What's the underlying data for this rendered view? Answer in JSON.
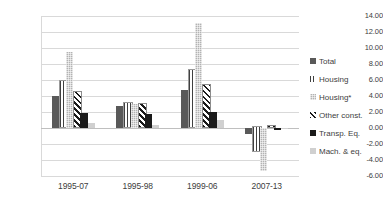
{
  "chart_data": {
    "type": "bar",
    "title": "",
    "subtitle": "",
    "xlabel": "",
    "ylabel": "",
    "ylim": [
      -6.0,
      14.0
    ],
    "ytick_step": 2.0,
    "yticks": [
      "14.00",
      "12.00",
      "10.00",
      "8.00",
      "6.00",
      "4.00",
      "2.00",
      "0.00",
      "-2.00",
      "-4.00",
      "-6.00"
    ],
    "ytick_values": [
      14,
      12,
      10,
      8,
      6,
      4,
      2,
      0,
      -2,
      -4,
      -6
    ],
    "grid": true,
    "legend_position": "right",
    "categories": [
      "1995-07",
      "1995-98",
      "1999-06",
      "2007-13"
    ],
    "series": [
      {
        "name": "Total",
        "color": "#595959",
        "pattern": "solid",
        "values": [
          4.0,
          2.8,
          4.7,
          -0.7
        ]
      },
      {
        "name": "Housing",
        "color": "#404040",
        "pattern": "vertical-lines",
        "values": [
          5.7,
          3.05,
          7.1,
          -3.0
        ]
      },
      {
        "name": "Housing*",
        "color": "#b3b3b3",
        "pattern": "checker",
        "values": [
          9.5,
          3.05,
          13.15,
          -5.4
        ]
      },
      {
        "name": "Other const.",
        "color": "#1a1a1a",
        "pattern": "diagonal-stripes",
        "values": [
          4.4,
          2.9,
          5.3,
          0.15
        ]
      },
      {
        "name": "Transp. Eq.",
        "color": "#1a1a1a",
        "pattern": "solid",
        "values": [
          1.85,
          1.7,
          2.0,
          -0.2
        ]
      },
      {
        "name": "Mach. & eq.",
        "color": "#d0d0d0",
        "pattern": "solid",
        "values": [
          0.65,
          0.4,
          1.0,
          -0.05
        ]
      }
    ]
  },
  "legend": {
    "items": [
      {
        "label": "Total"
      },
      {
        "label": "Housing"
      },
      {
        "label": "Housing*"
      },
      {
        "label": "Other const."
      },
      {
        "label": "Transp. Eq."
      },
      {
        "label": "Mach. & eq."
      }
    ]
  },
  "colors": {
    "gridline": "#d9d9d9",
    "axis_text": "#404040",
    "background": "#ffffff"
  }
}
